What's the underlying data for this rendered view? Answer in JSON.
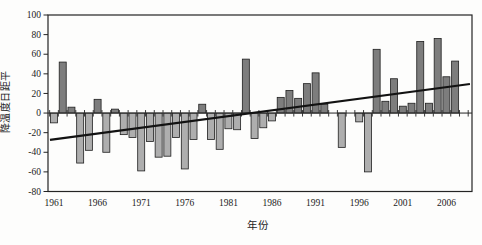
{
  "figure": {
    "xlabel": "年份",
    "ylabel": "降温度日距平"
  },
  "chart_data": {
    "type": "bar",
    "title": "",
    "xlabel": "年份",
    "ylabel": "降温度日距平",
    "ylim": [
      -80,
      100
    ],
    "y_ticks": [
      100,
      80,
      60,
      40,
      20,
      0,
      -20,
      -40,
      -60,
      -80
    ],
    "y_tick_labels": [
      "100",
      "80",
      "60",
      "40",
      "20",
      "0",
      "-20",
      "-40",
      "-60",
      "-80"
    ],
    "x_tick_labels": [
      "1961",
      "1966",
      "1971",
      "1976",
      "1981",
      "1986",
      "1991",
      "1996",
      "2001",
      "2006"
    ],
    "x_label_years": [
      1961,
      1966,
      1971,
      1976,
      1981,
      1986,
      1991,
      1996,
      2001,
      2006
    ],
    "grid": false,
    "legend": "none",
    "years": [
      1961,
      1962,
      1963,
      1964,
      1965,
      1966,
      1967,
      1968,
      1969,
      1970,
      1971,
      1972,
      1973,
      1974,
      1975,
      1976,
      1977,
      1978,
      1979,
      1980,
      1981,
      1982,
      1983,
      1984,
      1985,
      1986,
      1987,
      1988,
      1989,
      1990,
      1991,
      1992,
      1993,
      1994,
      1995,
      1996,
      1997,
      1998,
      1999,
      2000,
      2001,
      2002,
      2003,
      2004,
      2005,
      2006,
      2007
    ],
    "values": [
      -10,
      52,
      6,
      -51,
      -38,
      14,
      -40,
      4,
      -22,
      -25,
      -59,
      -29,
      -45,
      -44,
      -25,
      -57,
      -27,
      9,
      -27,
      -37,
      -16,
      -17,
      55,
      -26,
      -15,
      -8,
      16,
      23,
      15,
      30,
      41,
      9,
      0,
      -35,
      0,
      -9,
      -60,
      65,
      12,
      35,
      7,
      10,
      73,
      10,
      76,
      37,
      53
    ],
    "trend_line": {
      "start_year": 1961,
      "start_value": -27.4,
      "end_year": 2008.7,
      "end_value": 29.6
    },
    "colors": {
      "positive_bar": "#7d7d7d",
      "negative_bar": "#aeaeae",
      "bar_outline": "#1f1f1f",
      "trend_line": "#121212",
      "axis": "#242424",
      "background": "#fdfdfc"
    }
  }
}
